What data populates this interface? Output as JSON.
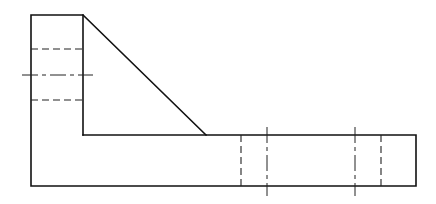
{
  "drawing": {
    "type": "orthographic-view",
    "colors": {
      "line": "#111111",
      "background": "#ffffff"
    },
    "outline": {
      "points": [
        [
          31,
          15
        ],
        [
          83,
          15
        ],
        [
          206,
          135
        ],
        [
          416,
          135
        ],
        [
          416,
          186
        ],
        [
          31,
          186
        ]
      ]
    },
    "inner_edges": [
      {
        "x1": 83,
        "y1": 15,
        "x2": 83,
        "y2": 135
      },
      {
        "x1": 83,
        "y1": 135,
        "x2": 206,
        "y2": 135
      }
    ],
    "hidden_lines": [
      {
        "x1": 31,
        "y1": 49,
        "x2": 83,
        "y2": 49
      },
      {
        "x1": 31,
        "y1": 100,
        "x2": 83,
        "y2": 100
      },
      {
        "x1": 241,
        "y1": 135,
        "x2": 241,
        "y2": 186
      },
      {
        "x1": 381,
        "y1": 135,
        "x2": 381,
        "y2": 186
      }
    ],
    "center_lines": [
      {
        "x1": 22,
        "y1": 75,
        "x2": 93,
        "y2": 75
      },
      {
        "x1": 267,
        "y1": 127,
        "x2": 267,
        "y2": 196
      },
      {
        "x1": 355,
        "y1": 127,
        "x2": 355,
        "y2": 196
      }
    ]
  }
}
